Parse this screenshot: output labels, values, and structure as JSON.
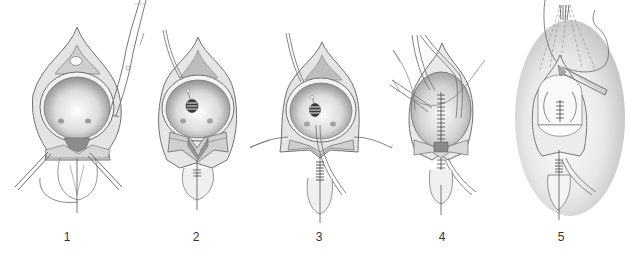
{
  "figure": {
    "panels": [
      {
        "number": "1",
        "label_x": 67
      },
      {
        "number": "2",
        "label_x": 185
      },
      {
        "number": "3",
        "label_x": 320
      },
      {
        "number": "4",
        "label_x": 444
      },
      {
        "number": "5",
        "label_x": 553
      }
    ]
  },
  "colors": {
    "line": "#6a6a6a",
    "tissue": "#d8d8d8",
    "tissue_dark": "#a9a9a9",
    "bladder_inner_center": "#ffffff",
    "bladder_inner_edge": "#8f8f8f",
    "shadow": "#c4c4c4"
  }
}
